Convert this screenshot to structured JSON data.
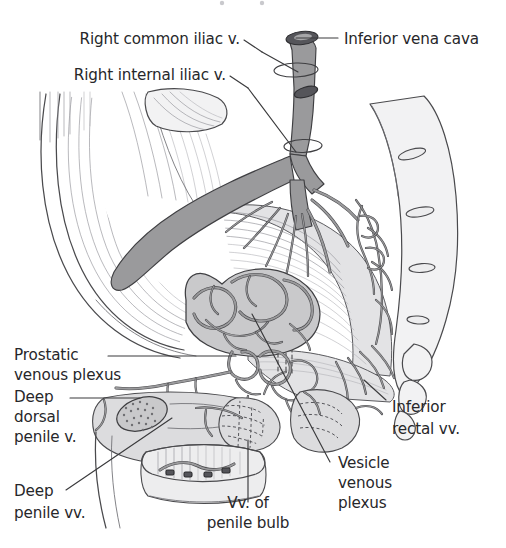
{
  "figure": {
    "title_cut_off": "",
    "bottom_caption_cut_off": "",
    "background_color": "#ffffff",
    "ink_color": "#27272a",
    "vessel_fill": "#9a9a9c",
    "bone_fill": "#f2f2f3",
    "organ_fill": "#c9c9cb"
  },
  "labels": {
    "right_common_iliac": {
      "line1": "Right common iliac v.",
      "lines": [
        "Right common iliac v."
      ]
    },
    "right_internal_iliac": {
      "line1": "Right internal iliac v.",
      "lines": [
        "Right internal iliac v."
      ]
    },
    "inferior_vena_cava": {
      "line1": "Inferior vena cava",
      "lines": [
        "Inferior vena cava"
      ]
    },
    "prostatic_venous_plexus": {
      "line1": "Prostatic",
      "line2": "venous plexus",
      "lines": [
        "Prostatic",
        "venous plexus"
      ]
    },
    "deep_dorsal_penile_v": {
      "line1": "Deep",
      "line2": "dorsal",
      "line3": "penile v.",
      "lines": [
        "Deep",
        "dorsal",
        "penile v."
      ]
    },
    "deep_penile_vv": {
      "line1": "Deep",
      "line2": "penile vv.",
      "lines": [
        "Deep",
        "penile vv."
      ]
    },
    "vv_of_penile_bulb": {
      "line1": "Vv. of",
      "line2": "penile bulb",
      "lines": [
        "Vv. of",
        "penile bulb"
      ]
    },
    "vesicle_venous_plexus": {
      "line1": "Vesicle",
      "line2": "venous",
      "line3": "plexus",
      "lines": [
        "Vesicle",
        "venous",
        "plexus"
      ]
    },
    "inferior_rectal_vv": {
      "line1": "Inferior",
      "line2": "rectal vv.",
      "lines": [
        "Inferior",
        "rectal vv."
      ]
    }
  }
}
